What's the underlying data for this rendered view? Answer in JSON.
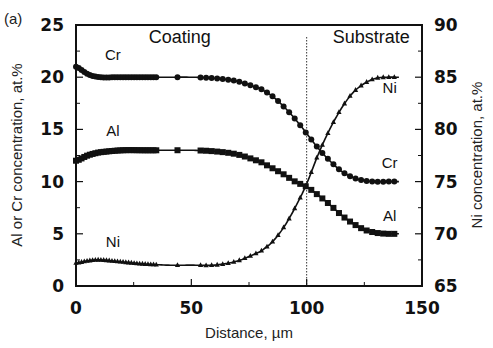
{
  "panel_label": "(a)",
  "chart_data": {
    "type": "line",
    "title": "",
    "xlabel": "Distance, µm",
    "ylabel": "Al or Cr concentration, at.%",
    "y2label": "Ni concentration, at.%",
    "xlim": [
      0,
      150
    ],
    "ylim": [
      0,
      25
    ],
    "y2lim": [
      65,
      90
    ],
    "xticks": [
      0,
      50,
      100,
      150
    ],
    "yticks": [
      0,
      5,
      10,
      15,
      20,
      25
    ],
    "y2ticks": [
      65,
      70,
      75,
      80,
      85,
      90
    ],
    "grid": false,
    "legend": "none (inline curve labels)",
    "annotations": [
      {
        "text": "Coating",
        "x": 45,
        "y": 23.3
      },
      {
        "text": "Substrate",
        "x": 128,
        "y": 23.3
      },
      {
        "text": "Cr",
        "x": 16,
        "y": 21.6
      },
      {
        "text": "Al",
        "x": 16,
        "y": 14.4
      },
      {
        "text": "Ni",
        "x": 16,
        "y": 3.7
      },
      {
        "text": "Ni",
        "x": 136,
        "y": 18.5
      },
      {
        "text": "Cr",
        "x": 136,
        "y": 11.3
      },
      {
        "text": "Al",
        "x": 136,
        "y": 6.2
      }
    ],
    "vertical_line": {
      "x": 100,
      "style": "dotted",
      "meaning": "coating/substrate interface"
    },
    "x": [
      0,
      5,
      10,
      20,
      30,
      40,
      50,
      60,
      70,
      80,
      85,
      90,
      95,
      100,
      105,
      110,
      115,
      120,
      125,
      130,
      135,
      140
    ],
    "series": [
      {
        "name": "Cr",
        "axis": "left",
        "marker": "circle",
        "values": [
          21.0,
          20.3,
          20.0,
          20.0,
          20.0,
          20.0,
          20.0,
          19.9,
          19.6,
          18.9,
          18.2,
          17.2,
          16.0,
          14.6,
          13.2,
          12.0,
          11.0,
          10.4,
          10.1,
          10.0,
          10.0,
          10.0
        ]
      },
      {
        "name": "Al",
        "axis": "left",
        "marker": "square",
        "values": [
          12.0,
          12.5,
          12.8,
          13.0,
          13.0,
          13.0,
          13.0,
          12.9,
          12.6,
          11.9,
          11.3,
          10.7,
          10.0,
          9.5,
          8.7,
          7.8,
          6.8,
          6.0,
          5.4,
          5.1,
          5.0,
          5.0
        ]
      },
      {
        "name": "Ni",
        "axis": "right",
        "marker": "triangle",
        "values": [
          67.2,
          67.4,
          67.5,
          67.3,
          67.1,
          67.0,
          67.0,
          67.0,
          67.4,
          68.3,
          69.2,
          70.6,
          72.5,
          74.8,
          77.6,
          80.0,
          82.0,
          83.5,
          84.4,
          84.9,
          85.0,
          85.0
        ]
      }
    ]
  }
}
